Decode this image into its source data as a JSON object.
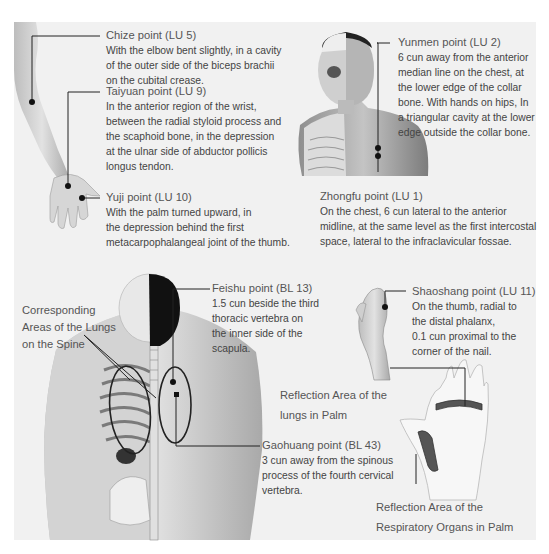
{
  "figure": {
    "background_color": "#f1f1f1",
    "line_color": "#222222"
  },
  "annotations": {
    "chize": {
      "title": "Chize point (LU 5)",
      "lines": [
        "With the elbow bent slightly, in a cavity",
        "of the outer side of the biceps brachii",
        "on the cubital crease."
      ]
    },
    "taiyuan": {
      "title": "Taiyuan point (LU 9)",
      "lines": [
        "In the anterior region of the wrist,",
        "between the radial styloid process and",
        "the scaphoid bone, in the depression",
        "at the ulnar side of abductor pollicis",
        "longus tendon."
      ]
    },
    "yuji": {
      "title": "Yuji point (LU 10)",
      "lines": [
        "With the palm turned upward, in",
        "the depression behind the first",
        "metacarpophalangeal joint of the thumb."
      ]
    },
    "yunmen": {
      "title": "Yunmen point (LU 2)",
      "lines": [
        "6 cun away from the anterior",
        "median line on the chest, at",
        "the lower edge of the collar",
        "bone. With hands on hips, In",
        "a triangular cavity at the lower",
        "edge outside the collar bone."
      ]
    },
    "zhongfu": {
      "title": "Zhongfu point  (LU 1)",
      "lines": [
        "On the chest, 6 cun lateral to the anterior",
        "midline, at the same level as the first intercostal",
        "space, lateral to the infraclavicular fossae."
      ]
    },
    "feishu": {
      "title": "Feishu point (BL 13)",
      "lines": [
        "1.5 cun beside the third",
        "thoracic vertebra on",
        "the inner side of the",
        "scapula."
      ]
    },
    "shaoshang": {
      "title": "Shaoshang point (LU 11)",
      "lines": [
        "On the thumb, radial to",
        "the distal phalanx,",
        "0.1 cun proximal to the",
        "corner of the nail."
      ]
    },
    "gaohuang": {
      "title": "Gaohuang point (BL 43)",
      "lines": [
        "3 cun away from the spinous",
        "process of the fourth cervical",
        "vertebra."
      ]
    }
  },
  "labels": {
    "spine_lungs": [
      "Corresponding",
      "Areas of the Lungs",
      "on the Spine"
    ],
    "palm_lungs": [
      "Reflection Area of the",
      "lungs in Palm"
    ],
    "palm_respiratory": [
      "Reflection Area of the",
      "Respiratory Organs in Palm"
    ]
  }
}
